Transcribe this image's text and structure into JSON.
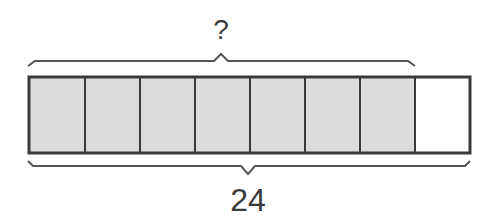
{
  "diagram": {
    "type": "tape-diagram",
    "total_label": "24",
    "part_label": "?",
    "cells_total": 8,
    "cells_shaded": 7,
    "colors": {
      "shaded": "#dcdcdc",
      "unshaded": "#ffffff",
      "stroke": "#3a3a3a"
    }
  }
}
